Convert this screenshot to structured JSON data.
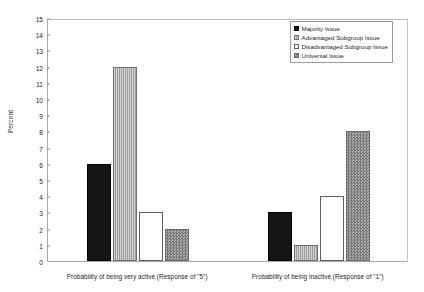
{
  "chart_data": {
    "type": "bar",
    "title": "",
    "xlabel": "",
    "ylabel": "Percent",
    "ylim": [
      0,
      15
    ],
    "ytick_step": 1,
    "grid": false,
    "legend_position": "top-right",
    "categories": [
      "Probability of being very active (Response of \"5\")",
      "Probability of being inactive (Response of \"1\")"
    ],
    "series": [
      {
        "name": "Majority Issue",
        "fill": "solid-black",
        "color": "#151515",
        "values": [
          6,
          3
        ]
      },
      {
        "name": "Advantaged Subgroup Issue",
        "fill": "vertical-gray",
        "color": "#9d9d9d",
        "values": [
          12,
          1
        ]
      },
      {
        "name": "Disadvantaged Subgroup Issue",
        "fill": "hollow",
        "color": "#ffffff",
        "values": [
          3,
          4
        ]
      },
      {
        "name": "Universal Issue",
        "fill": "checker-gray",
        "color": "#8d8d8d",
        "values": [
          2,
          8
        ]
      }
    ],
    "ytick_labels": [
      "0",
      "1",
      "2",
      "3",
      "4",
      "5",
      "6",
      "7",
      "8",
      "9",
      "10",
      "11",
      "12",
      "13",
      "14",
      "15"
    ]
  },
  "axis": {
    "y_title": "Percent"
  },
  "legend": {
    "items": [
      {
        "label": "Majority Issue"
      },
      {
        "label": "Advantaged Subgroup Issue"
      },
      {
        "label": "Disadvantaged Subgroup Issue"
      },
      {
        "label": "Universal Issue"
      }
    ]
  }
}
